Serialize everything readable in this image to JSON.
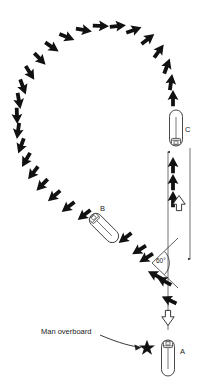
{
  "diagram": {
    "type": "nautical-maneuver-diagram",
    "background_color": "#ffffff",
    "ink_color": "#111111",
    "accent_color": "#2f5e3f",
    "labels": {
      "vessel_a": "A",
      "vessel_b": "B",
      "vessel_c": "C",
      "angle": "60°",
      "callout": "Man overboard"
    },
    "vessels": [
      {
        "id": "A",
        "label": "A",
        "x": 168,
        "y": 358,
        "rotation": 0,
        "length": 36,
        "width": 13,
        "heading": "north"
      },
      {
        "id": "B",
        "label": "B",
        "x": 104,
        "y": 228,
        "rotation": -45,
        "length": 36,
        "width": 13,
        "heading": "northwest"
      },
      {
        "id": "C",
        "label": "C",
        "x": 176,
        "y": 128,
        "rotation": 180,
        "length": 36,
        "width": 13,
        "heading": "south"
      }
    ],
    "marker": {
      "name": "man-overboard-star",
      "shape": "five-point-star",
      "x": 146,
      "y": 348,
      "radius": 7.5,
      "color": "#111111"
    },
    "callout_leader": {
      "x1": 100,
      "y1": 337,
      "x2": 140,
      "y2": 347
    },
    "angle_mark": {
      "vertex_x": 152,
      "vertex_y": 263,
      "upper_ray_x": 176,
      "upper_ray_y": 243,
      "lower_ray_x": 176,
      "lower_ray_y": 283,
      "arc_radius": 13,
      "text": "60°",
      "text_x": 157,
      "text_y": 260
    },
    "guide_lines": [
      {
        "name": "track-line-outbound",
        "x1": 168,
        "y1": 330,
        "x2": 168,
        "y2": 232,
        "arrow": "none"
      },
      {
        "name": "track-line-return",
        "x1": 168,
        "y1": 232,
        "x2": 168,
        "y2": 150,
        "arrow": "up",
        "tip_x": 168,
        "tip_y": 150
      },
      {
        "name": "track-line-approach",
        "x1": 190,
        "y1": 148,
        "x2": 190,
        "y2": 262,
        "arrow": "down",
        "tip_x": 190,
        "tip_y": 262
      },
      {
        "name": "angle-ray-upper",
        "x1": 152,
        "y1": 263,
        "x2": 176,
        "y2": 240,
        "arrow": "none"
      },
      {
        "name": "angle-ray-lower",
        "x1": 152,
        "y1": 263,
        "x2": 176,
        "y2": 286,
        "arrow": "none"
      }
    ],
    "hollow_arrows": [
      {
        "name": "hollow-arrow-heading-north",
        "x": 168,
        "y": 318,
        "direction": "up",
        "size": 13
      },
      {
        "name": "hollow-arrow-heading-south",
        "x": 179,
        "y": 203,
        "direction": "down",
        "size": 13
      }
    ],
    "track_arrows": [
      {
        "x": 169,
        "y": 300,
        "angle": -65
      },
      {
        "x": 164,
        "y": 281,
        "angle": -62
      },
      {
        "x": 155,
        "y": 275,
        "angle": -62
      },
      {
        "x": 146,
        "y": 258,
        "angle": -122
      },
      {
        "x": 139,
        "y": 250,
        "angle": -122
      },
      {
        "x": 125,
        "y": 238,
        "angle": -128
      },
      {
        "x": 84,
        "y": 215,
        "angle": -128
      },
      {
        "x": 68,
        "y": 207,
        "angle": -128
      },
      {
        "x": 54,
        "y": 196,
        "angle": -131
      },
      {
        "x": 42,
        "y": 185,
        "angle": -136
      },
      {
        "x": 33,
        "y": 173,
        "angle": -142
      },
      {
        "x": 26,
        "y": 160,
        "angle": -150
      },
      {
        "x": 21,
        "y": 146,
        "angle": -160
      },
      {
        "x": 18,
        "y": 131,
        "angle": -172
      },
      {
        "x": 17,
        "y": 116,
        "angle": 178
      },
      {
        "x": 19,
        "y": 101,
        "angle": 170
      },
      {
        "x": 23,
        "y": 87,
        "angle": 160
      },
      {
        "x": 30,
        "y": 73,
        "angle": 148
      },
      {
        "x": 40,
        "y": 59,
        "angle": 136
      },
      {
        "x": 52,
        "y": 47,
        "angle": 124
      },
      {
        "x": 67,
        "y": 37,
        "angle": 112
      },
      {
        "x": 84,
        "y": 30,
        "angle": 100
      },
      {
        "x": 101,
        "y": 26,
        "angle": 92
      },
      {
        "x": 118,
        "y": 26,
        "angle": 84
      },
      {
        "x": 134,
        "y": 30,
        "angle": 70
      },
      {
        "x": 148,
        "y": 39,
        "angle": 52
      },
      {
        "x": 159,
        "y": 51,
        "angle": 36
      },
      {
        "x": 167,
        "y": 66,
        "angle": 20
      },
      {
        "x": 171,
        "y": 82,
        "angle": 8
      },
      {
        "x": 173,
        "y": 98,
        "angle": 0
      },
      {
        "x": 173,
        "y": 165,
        "angle": 0
      },
      {
        "x": 173,
        "y": 182,
        "angle": 0
      },
      {
        "x": 173,
        "y": 199,
        "angle": 0
      }
    ],
    "accent_arrow_index": 25
  }
}
